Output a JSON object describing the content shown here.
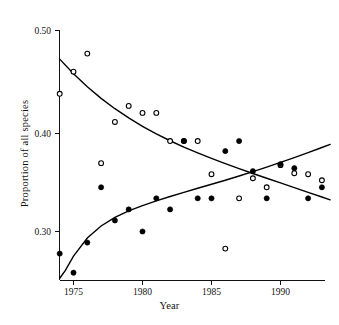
{
  "figure": {
    "background": "#ffffff",
    "foreground": "#111111"
  },
  "labels": {
    "xlabel": "Year",
    "ylabel": "Proportion of all species"
  },
  "chart_data": {
    "type": "scatter",
    "title": "",
    "subtitle": "",
    "xlabel": "Year",
    "ylabel": "Proportion of all species",
    "xlim": [
      1973.6,
      1993.6
    ],
    "ylim": [
      0.25,
      0.5
    ],
    "xticks": [
      1975,
      1980,
      1985,
      1990
    ],
    "xticklabels": [
      "1975",
      "1980",
      "1985",
      "1990"
    ],
    "yticks": [
      0.3,
      0.4,
      0.5
    ],
    "yticklabels": [
      "0.30",
      "0.40",
      "0.50"
    ],
    "grid": false,
    "legend": "none",
    "axis_style": "left-and-bottom-spines-with-outward-ticks",
    "series": [
      {
        "name": "open-circles",
        "marker": "open-circle",
        "color": "#000000",
        "x": [
          1974,
          1975,
          1976,
          1977,
          1978,
          1979,
          1980,
          1981,
          1982,
          1983,
          1984,
          1985,
          1986,
          1987,
          1988,
          1989,
          1990,
          1991,
          1992,
          1993
        ],
        "y": [
          0.437,
          0.459,
          0.477,
          0.368,
          0.409,
          0.425,
          0.418,
          0.418,
          0.39,
          0.39,
          0.39,
          0.357,
          0.283,
          0.333,
          0.353,
          0.344,
          0.366,
          0.358,
          0.357,
          0.351
        ]
      },
      {
        "name": "filled-circles",
        "marker": "filled-circle",
        "color": "#000000",
        "x": [
          1974,
          1975,
          1976,
          1977,
          1978,
          1979,
          1980,
          1981,
          1982,
          1983,
          1984,
          1985,
          1986,
          1987,
          1988,
          1989,
          1990,
          1991,
          1992,
          1993
        ],
        "y": [
          0.278,
          0.259,
          0.289,
          0.344,
          0.311,
          0.322,
          0.3,
          0.333,
          0.322,
          0.39,
          0.333,
          0.333,
          0.38,
          0.39,
          0.36,
          0.333,
          0.367,
          0.363,
          0.333,
          0.344
        ]
      }
    ],
    "fitted_curves": [
      {
        "name": "declining-fit",
        "description": "smooth decreasing curve fitted to open circles",
        "points_x": [
          1974.0,
          1975.0,
          1976.0,
          1977.0,
          1978.0,
          1979.0,
          1980.0,
          1981.0,
          1982.0,
          1983.0,
          1984.0,
          1985.0,
          1986.0,
          1987.0,
          1988.0,
          1989.0,
          1990.0,
          1991.0,
          1992.0,
          1993.0,
          1993.6
        ],
        "points_y": [
          0.4715,
          0.457,
          0.444,
          0.4325,
          0.4222,
          0.413,
          0.4047,
          0.3972,
          0.3903,
          0.384,
          0.3782,
          0.3727,
          0.3675,
          0.3625,
          0.3577,
          0.353,
          0.3483,
          0.3437,
          0.339,
          0.3343,
          0.3315
        ]
      },
      {
        "name": "rising-fit",
        "description": "smooth increasing curve fitted to filled circles",
        "points_x": [
          1974.0,
          1974.4,
          1975.0,
          1976.0,
          1977.0,
          1978.0,
          1979.0,
          1980.0,
          1981.0,
          1982.0,
          1983.0,
          1984.0,
          1985.0,
          1986.0,
          1987.0,
          1988.0,
          1989.0,
          1990.0,
          1991.0,
          1992.0,
          1993.0,
          1993.6
        ],
        "points_y": [
          0.2535,
          0.261,
          0.2755,
          0.2935,
          0.3055,
          0.314,
          0.3205,
          0.3258,
          0.3305,
          0.3348,
          0.339,
          0.343,
          0.347,
          0.351,
          0.3552,
          0.3595,
          0.364,
          0.3687,
          0.3735,
          0.3785,
          0.3836,
          0.3867
        ]
      }
    ]
  }
}
